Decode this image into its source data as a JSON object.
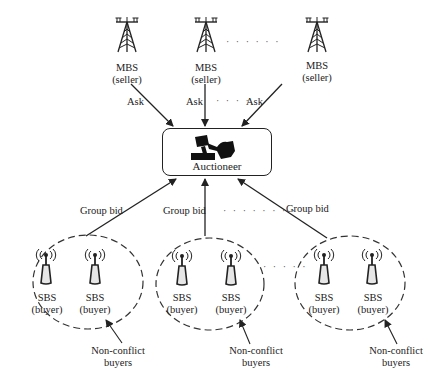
{
  "diagram": {
    "colors": {
      "line": "#222222",
      "background": "#ffffff"
    },
    "sellers": [
      {
        "label_line1": "MBS",
        "label_line2": "(seller)",
        "icon": "cell-tower-icon",
        "edge_label": "Ask"
      },
      {
        "label_line1": "MBS",
        "label_line2": "(seller)",
        "icon": "cell-tower-icon",
        "edge_label": "Ask"
      },
      {
        "label_line1": "MBS",
        "label_line2": "(seller)",
        "icon": "cell-tower-icon",
        "edge_label": "Ask"
      }
    ],
    "seller_ellipsis": "· · · · · ·",
    "ask_ellipsis": "· · · ·",
    "auctioneer": {
      "label": "Auctioneer",
      "icon": "gavel-icon"
    },
    "groups": [
      {
        "edge_label": "Group bid",
        "buyers": [
          {
            "label_line1": "SBS",
            "label_line2": "(buyer)",
            "icon": "small-cell-antenna-icon"
          },
          {
            "label_line1": "SBS",
            "label_line2": "(buyer)",
            "icon": "small-cell-antenna-icon"
          }
        ],
        "annotation_line1": "Non-conflict",
        "annotation_line2": "buyers"
      },
      {
        "edge_label": "Group bid",
        "buyers": [
          {
            "label_line1": "SBS",
            "label_line2": "(buyer)",
            "icon": "small-cell-antenna-icon"
          },
          {
            "label_line1": "SBS",
            "label_line2": "(buyer)",
            "icon": "small-cell-antenna-icon"
          }
        ],
        "annotation_line1": "Non-conflict",
        "annotation_line2": "buyers"
      },
      {
        "edge_label": "Group bid",
        "buyers": [
          {
            "label_line1": "SBS",
            "label_line2": "(buyer)",
            "icon": "small-cell-antenna-icon"
          },
          {
            "label_line1": "SBS",
            "label_line2": "(buyer)",
            "icon": "small-cell-antenna-icon"
          }
        ],
        "annotation_line1": "Non-conflict",
        "annotation_line2": "buyers"
      }
    ],
    "bid_ellipsis": "· · · · · · · ·",
    "group_ellipsis": "· · · · ·"
  }
}
